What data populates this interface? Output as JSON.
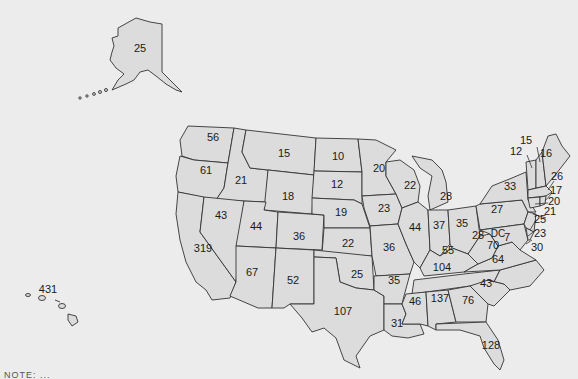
{
  "map": {
    "title": "United States map with per-state values",
    "fill_color": "#dcdcdc",
    "border_color": "#333333",
    "background_color": "#ececec",
    "states": {
      "AK": 25,
      "HI": 431,
      "WA": 56,
      "OR": 61,
      "CA": 319,
      "ID": 21,
      "NV": 43,
      "MT": 15,
      "WY": 18,
      "UT": 44,
      "AZ": 67,
      "CO": 36,
      "NM": 52,
      "ND": 10,
      "SD": 12,
      "NE": 19,
      "KS": 22,
      "OK": 25,
      "TX": 107,
      "MN": 20,
      "IA": 23,
      "MO": 36,
      "AR": 35,
      "LA": 31,
      "WI": 22,
      "IL": 44,
      "MI": 28,
      "IN": 37,
      "OH": 35,
      "KY": 55,
      "TN": 104,
      "MS": 46,
      "AL": 137,
      "GA": 76,
      "FL": 128,
      "SC": 43,
      "NC": 64,
      "VA": 70,
      "WV": 28,
      "DC": 7,
      "PA": 27,
      "NY": 33,
      "VT": 12,
      "NH": 15,
      "ME": 16,
      "MA": 26,
      "RI": 17,
      "CT": 20,
      "NJ": 21,
      "DE": 25,
      "MD": 23,
      "DC_label": "DC",
      "MD_callout": 30
    },
    "labels": {
      "AK": "25",
      "HI": "431",
      "WA": "56",
      "OR": "61",
      "CA": "319",
      "ID": "21",
      "NV": "43",
      "MT": "15",
      "WY": "18",
      "UT": "44",
      "AZ": "67",
      "CO": "36",
      "NM": "52",
      "ND": "10",
      "SD": "12",
      "NE": "19",
      "KS": "22",
      "OK": "25",
      "TX": "107",
      "MN": "20",
      "IA": "23",
      "MO": "36",
      "AR": "35",
      "LA": "31",
      "WI": "22",
      "IL": "44",
      "MI": "28",
      "IN": "37",
      "OH": "35",
      "KY": "55",
      "TN": "104",
      "MS": "46",
      "AL": "137",
      "GA": "76",
      "FL": "128",
      "SC": "43",
      "NC": "64",
      "VA": "70",
      "WV": "28",
      "DC": "7",
      "DC_text": "DC",
      "PA": "27",
      "NY": "33",
      "VT": "12",
      "NH": "15",
      "ME": "16",
      "MA": "26",
      "RI": "17",
      "CT": "20",
      "NJ": "21",
      "DE": "25",
      "MD": "23",
      "MD2": "30"
    },
    "footer_text": "NOTE: ..."
  }
}
